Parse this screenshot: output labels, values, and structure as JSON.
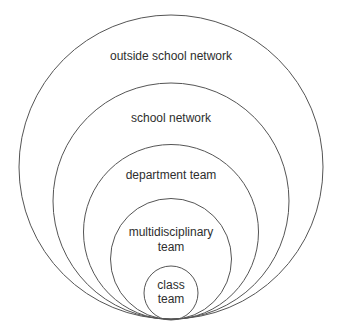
{
  "diagram": {
    "type": "nested-circles",
    "stroke_color": "#555555",
    "text_color": "#2e2e2e",
    "levels": [
      {
        "id": "outside-school-network",
        "lines": [
          "outside school network"
        ],
        "cx": 171,
        "cy": 167,
        "r": 152
      },
      {
        "id": "school-network",
        "lines": [
          "school network"
        ],
        "cx": 171,
        "cy": 201,
        "r": 118
      },
      {
        "id": "department-team",
        "lines": [
          "department team"
        ],
        "cx": 171,
        "cy": 232,
        "r": 87.5
      },
      {
        "id": "multidisciplinary-team",
        "lines": [
          "multidisciplinary",
          "team"
        ],
        "cx": 171,
        "cy": 259,
        "r": 60.5
      },
      {
        "id": "class-team",
        "lines": [
          "class",
          "team"
        ],
        "cx": 171,
        "cy": 293,
        "r": 27
      }
    ]
  }
}
